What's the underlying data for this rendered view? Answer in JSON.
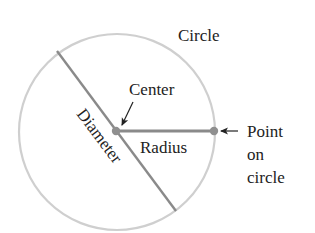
{
  "diagram": {
    "title": "Circle",
    "labels": {
      "center": "Center",
      "diameter": "Diameter",
      "radius": "Radius",
      "point_line1": "Point",
      "point_line2": "on",
      "point_line3": "circle"
    },
    "colors": {
      "circle_stroke": "#cfcfcf",
      "line_stroke": "#8a8a8a",
      "dot_fill": "#8f8f8f",
      "text": "#222222",
      "arrow": "#222222"
    }
  }
}
